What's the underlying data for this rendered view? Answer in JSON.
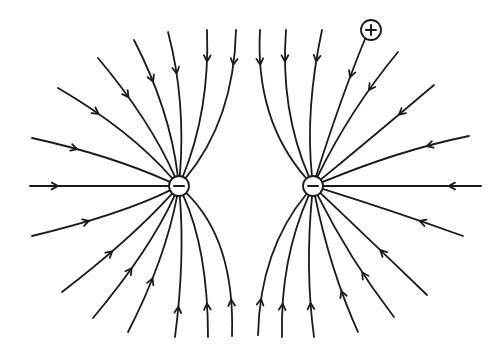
{
  "diagram": {
    "charges": [
      {
        "id": "left-negative",
        "sign": "negative",
        "symbol": "−"
      },
      {
        "id": "right-negative",
        "sign": "negative",
        "symbol": "−"
      },
      {
        "id": "test-positive",
        "sign": "positive",
        "symbol": "+"
      }
    ],
    "field_line_direction": "inward toward negative charges",
    "field_lines_per_charge": 15
  }
}
